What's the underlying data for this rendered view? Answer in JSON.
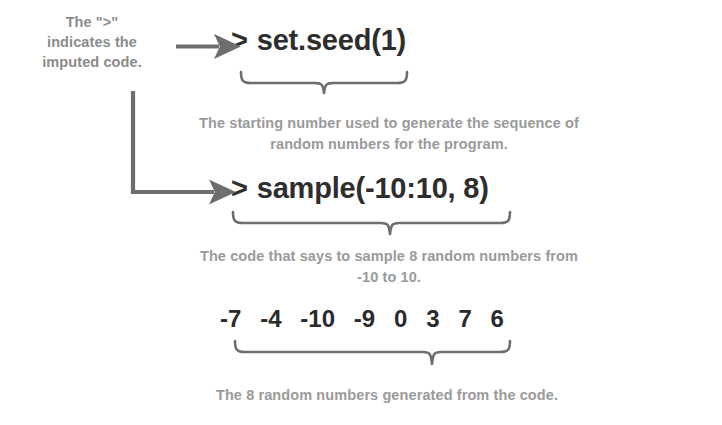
{
  "figure": {
    "background_color": "#ffffff",
    "ink_color": "#4a4a4a",
    "code_color": "#2e2e2e",
    "caption_color": "#9a9a9a"
  },
  "left_annotation": {
    "line1": "The \">\"",
    "line2": "indicates the",
    "line3": "imputed code."
  },
  "code": {
    "prompt": ">",
    "line1": "set.seed(1)",
    "line2": "sample(-10:10, 8)"
  },
  "captions": {
    "seed": "The starting number used to generate the sequence of random numbers for the program.",
    "sample": "The code that says to sample 8 random numbers from -10 to 10.",
    "output": "The 8 random numbers generated from the code."
  },
  "output_numbers": [
    "-7",
    "-4",
    "-10",
    "-9",
    "0",
    "3",
    "7",
    "6"
  ]
}
